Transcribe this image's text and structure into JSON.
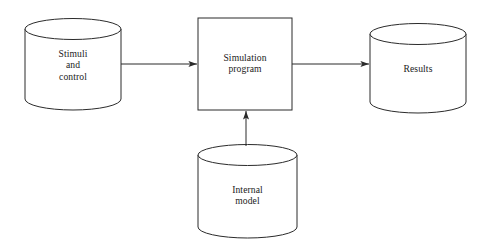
{
  "diagram": {
    "background_color": "#ffffff",
    "stroke_color": "#2b2b2b",
    "text_color": "#1a1a1a",
    "nodes": [
      {
        "id": "stimuli-and-control",
        "shape": "cylinder",
        "label": "Stimuli\nand\ncontrol",
        "label_lines": [
          "Stimuli",
          "and",
          "control"
        ],
        "x": 25,
        "y": 20,
        "width": 96,
        "height": 88
      },
      {
        "id": "simulation-program",
        "shape": "rectangle",
        "label": "Simulation\nprogram",
        "label_lines": [
          "Simulation",
          "program"
        ],
        "x": 198,
        "y": 18,
        "width": 94,
        "height": 92
      },
      {
        "id": "results",
        "shape": "cylinder",
        "label": "Results",
        "label_lines": [
          "Results"
        ],
        "x": 370,
        "y": 25,
        "width": 96,
        "height": 88
      },
      {
        "id": "internal-model",
        "shape": "cylinder",
        "label": "Internal\nmodel",
        "label_lines": [
          "Internal",
          "model"
        ],
        "x": 198,
        "y": 145,
        "width": 99,
        "height": 93
      }
    ],
    "edges": [
      {
        "id": "stimuli-to-simulation",
        "from": "stimuli-and-control",
        "to": "simulation-program",
        "direction": "right",
        "label": ""
      },
      {
        "id": "simulation-to-results",
        "from": "simulation-program",
        "to": "results",
        "direction": "right",
        "label": ""
      },
      {
        "id": "internal-model-to-simulation",
        "from": "internal-model",
        "to": "simulation-program",
        "direction": "up",
        "label": ""
      }
    ]
  }
}
